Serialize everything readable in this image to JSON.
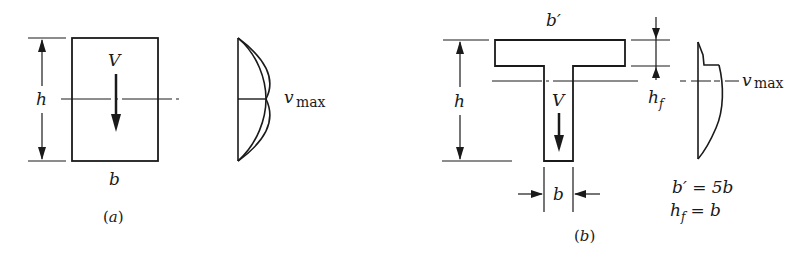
{
  "figure_a": {
    "caption": "(a)",
    "force_label": "V",
    "height_label": "h",
    "width_label": "b",
    "stress_label_main": "v",
    "stress_label_sub": "max",
    "description": "Rectangular section with parabolic shear stress distribution"
  },
  "figure_b": {
    "caption": "(b)",
    "force_label": "V",
    "height_label": "h",
    "web_width_label": "b",
    "flange_width_label": "b′",
    "flange_thickness_label_main": "h",
    "flange_thickness_label_sub": "f",
    "stress_label_main": "v",
    "stress_label_sub": "max",
    "equation_1": "b′ = 5b",
    "equation_2_main": "h",
    "equation_2_sub": "f",
    "equation_2_rest": " = b",
    "description": "T-section with shear stress distribution showing jump at flange-web junction"
  },
  "colors": {
    "line": "#1a1a1a",
    "background": "#ffffff"
  }
}
